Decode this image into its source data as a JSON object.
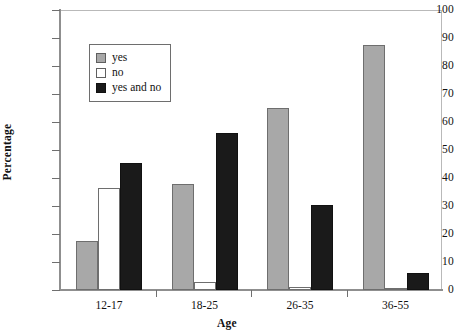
{
  "chart_data": {
    "type": "bar",
    "title": "",
    "xlabel": "Age",
    "ylabel": "Percentage",
    "categories": [
      "12-17",
      "18-25",
      "26-35",
      "36-55"
    ],
    "series": [
      {
        "name": "yes",
        "color": "#a8a8a8",
        "values": [
          17.5,
          38,
          65,
          87.5
        ]
      },
      {
        "name": "no",
        "color": "#ffffff",
        "values": [
          36.5,
          3,
          1,
          0.5
        ]
      },
      {
        "name": "yes and no",
        "color": "#1a1a1a",
        "values": [
          45.5,
          56,
          30.5,
          6
        ]
      }
    ],
    "ylim": [
      0,
      100
    ],
    "yticks": [
      0,
      10,
      20,
      30,
      40,
      50,
      60,
      70,
      80,
      90,
      100
    ],
    "ytick_labels": [
      "0",
      "10",
      "20",
      "30",
      "40",
      "50",
      "60",
      "70",
      "80",
      "90",
      "100"
    ],
    "grid": false,
    "legend_position": "upper-left",
    "legend_entries": [
      "yes",
      "no",
      "yes and no"
    ]
  }
}
